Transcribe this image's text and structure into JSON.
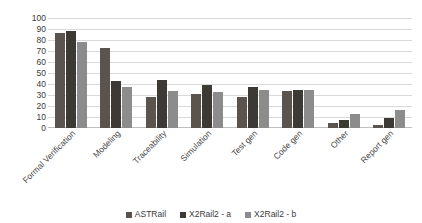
{
  "chart_data": {
    "type": "bar",
    "title": "",
    "xlabel": "",
    "ylabel": "",
    "ylim": [
      0,
      100
    ],
    "yticks": [
      100,
      90,
      80,
      70,
      60,
      50,
      40,
      30,
      20,
      10,
      0
    ],
    "grid": true,
    "legend_position": "bottom",
    "categories": [
      "Formal Verification",
      "Modeling",
      "Traceability",
      "Simulation",
      "Test gen",
      "Code gen",
      "Other",
      "Report gen"
    ],
    "series": [
      {
        "name": "ASTRail",
        "color": "#5b534d",
        "values": [
          86,
          73,
          28,
          31,
          28,
          34,
          5,
          3
        ]
      },
      {
        "name": "X2Rail2 - a",
        "color": "#3d3935",
        "values": [
          88,
          43,
          44,
          39,
          37,
          35,
          7,
          9
        ]
      },
      {
        "name": "X2Rail2 - b",
        "color": "#8c8c8c",
        "values": [
          78,
          37,
          34,
          33,
          35,
          35,
          13,
          16
        ]
      }
    ]
  },
  "colors": {
    "series_0": "#5b534d",
    "series_1": "#3d3935",
    "series_2": "#8c8c8c",
    "gridline": "#d9d9d9",
    "axis_text": "#3a3a3a",
    "background": "#ffffff"
  }
}
